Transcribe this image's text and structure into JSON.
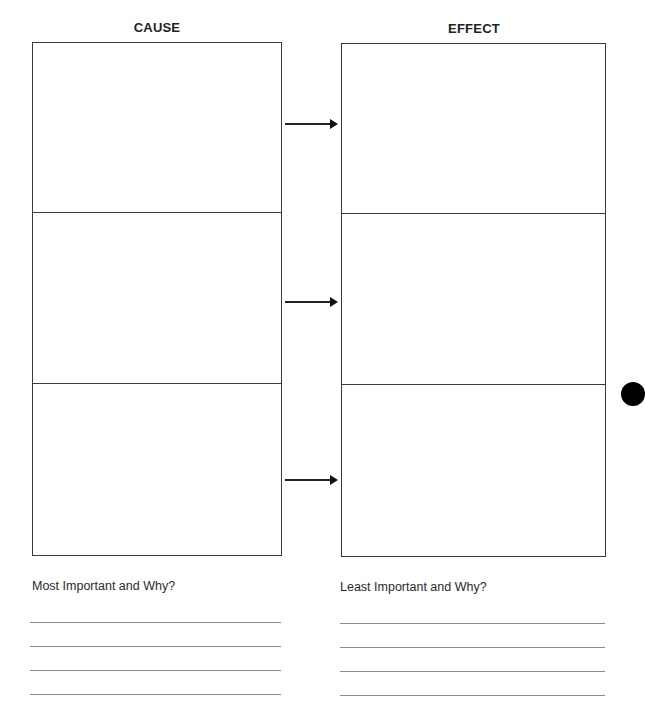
{
  "worksheet": {
    "columns": [
      {
        "heading": "CAUSE",
        "rows": 3
      },
      {
        "heading": "EFFECT",
        "rows": 3
      }
    ],
    "arrows": 3,
    "prompts": {
      "left": "Most Important and Why?",
      "right": "Least Important and Why?"
    },
    "answer_lines_per_prompt": 4,
    "colors": {
      "border": "#3a3a3a",
      "answer_line": "#8a8a8a",
      "punch_hole": "#000000"
    }
  }
}
